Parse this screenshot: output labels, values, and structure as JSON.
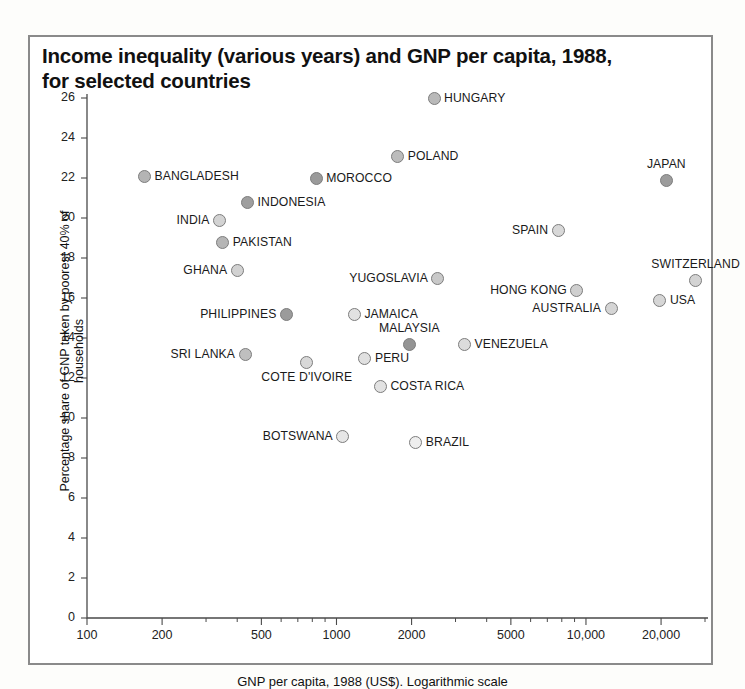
{
  "title": "Income inequality (various years) and GNP per capita, 1988, for selected countries",
  "axes": {
    "ytitle": "Percentage share of GNP taken by poorest 40% of households",
    "xtitle": "GNP per capita, 1988 (US$). Logarithmic scale",
    "yticks": [
      0,
      2,
      4,
      6,
      8,
      10,
      12,
      14,
      16,
      18,
      20,
      22,
      24,
      26
    ],
    "xticks": [
      100,
      200,
      500,
      1000,
      2000,
      5000,
      10000,
      20000
    ],
    "xtick_labels": [
      "100",
      "200",
      "500",
      "1000",
      "2000",
      "5000",
      "10,000",
      "20,000"
    ]
  },
  "chart_data": {
    "type": "scatter",
    "title": "Income inequality (various years) and GNP per capita, 1988, for selected countries",
    "xlabel": "GNP per capita, 1988 (US$). Logarithmic scale",
    "ylabel": "Percentage share of GNP taken by poorest 40% of households",
    "xscale": "log",
    "xlim": [
      100,
      30000
    ],
    "ylim": [
      0,
      26
    ],
    "grid": false,
    "legend": "none",
    "points": [
      {
        "name": "HUNGARY",
        "x": 2460,
        "y": 26.0,
        "label_pos": "r",
        "fill": "#b9b9b9"
      },
      {
        "name": "POLAND",
        "x": 1760,
        "y": 23.1,
        "label_pos": "r",
        "fill": "#bcbcbc"
      },
      {
        "name": "BANGLADESH",
        "x": 170,
        "y": 22.1,
        "label_pos": "r",
        "fill": "#b4b4b4"
      },
      {
        "name": "MOROCCO",
        "x": 830,
        "y": 22.0,
        "label_pos": "r",
        "fill": "#9a9a9a"
      },
      {
        "name": "JAPAN",
        "x": 21000,
        "y": 21.9,
        "label_pos": "t",
        "fill": "#9c9c9c"
      },
      {
        "name": "INDONESIA",
        "x": 440,
        "y": 20.8,
        "label_pos": "r",
        "fill": "#9e9e9e"
      },
      {
        "name": "INDIA",
        "x": 340,
        "y": 19.9,
        "label_pos": "l",
        "fill": "#d3d3d3"
      },
      {
        "name": "SPAIN",
        "x": 7740,
        "y": 19.4,
        "label_pos": "l",
        "fill": "#d8d8d8"
      },
      {
        "name": "PAKISTAN",
        "x": 350,
        "y": 18.8,
        "label_pos": "r",
        "fill": "#b5b5b5"
      },
      {
        "name": "SWITZERLAND",
        "x": 27500,
        "y": 16.9,
        "label_pos": "t",
        "fill": "#d3d3d3"
      },
      {
        "name": "GHANA",
        "x": 400,
        "y": 17.4,
        "label_pos": "l",
        "fill": "#d2d2d2"
      },
      {
        "name": "YUGOSLAVIA",
        "x": 2550,
        "y": 17.0,
        "label_pos": "l",
        "fill": "#c9c9c9"
      },
      {
        "name": "HONG KONG",
        "x": 9200,
        "y": 16.4,
        "label_pos": "l",
        "fill": "#cfcfcf"
      },
      {
        "name": "USA",
        "x": 19800,
        "y": 15.9,
        "label_pos": "r",
        "fill": "#d6d6d6"
      },
      {
        "name": "AUSTRALIA",
        "x": 12600,
        "y": 15.5,
        "label_pos": "l",
        "fill": "#d5d5d5"
      },
      {
        "name": "PHILIPPINES",
        "x": 630,
        "y": 15.2,
        "label_pos": "l",
        "fill": "#9b9b9b"
      },
      {
        "name": "JAMAICA",
        "x": 1180,
        "y": 15.2,
        "label_pos": "r",
        "fill": "#e2e2e2"
      },
      {
        "name": "MALAYSIA",
        "x": 1960,
        "y": 13.7,
        "label_pos": "t",
        "fill": "#949494"
      },
      {
        "name": "VENEZUELA",
        "x": 3260,
        "y": 13.7,
        "label_pos": "r",
        "fill": "#dcdcdc"
      },
      {
        "name": "SRI LANKA",
        "x": 430,
        "y": 13.2,
        "label_pos": "l",
        "fill": "#bfbfbf"
      },
      {
        "name": "PERU",
        "x": 1300,
        "y": 13.0,
        "label_pos": "r",
        "fill": "#e0e0e0"
      },
      {
        "name": "COTE D'IVOIRE",
        "x": 760,
        "y": 12.8,
        "label_pos": "b",
        "fill": "#d8d8d8"
      },
      {
        "name": "COSTA RICA",
        "x": 1500,
        "y": 11.6,
        "label_pos": "r",
        "fill": "#e2e2e2"
      },
      {
        "name": "BOTSWANA",
        "x": 1060,
        "y": 9.1,
        "label_pos": "l",
        "fill": "#e6e6e6"
      },
      {
        "name": "BRAZIL",
        "x": 2080,
        "y": 8.8,
        "label_pos": "r",
        "fill": "#eeeeee"
      }
    ]
  }
}
